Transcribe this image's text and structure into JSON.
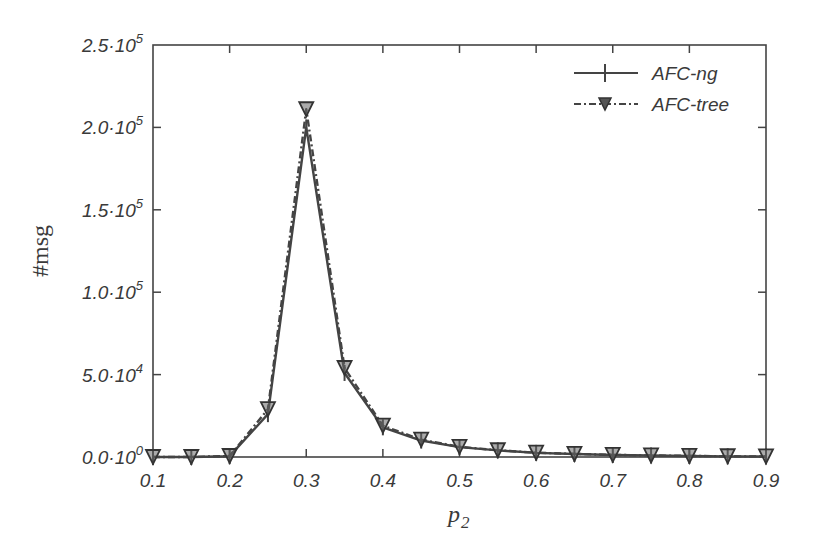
{
  "chart_data": {
    "type": "line",
    "title": "",
    "xlabel": "p_2",
    "ylabel": "#msg",
    "xlim": [
      0.1,
      0.9
    ],
    "ylim": [
      0,
      250000
    ],
    "grid": false,
    "legend_position": "upper right",
    "x_ticks": [
      "0.1",
      "0.2",
      "0.3",
      "0.4",
      "0.5",
      "0.6",
      "0.7",
      "0.8",
      "0.9"
    ],
    "y_ticks": [
      {
        "mant": "0.0",
        "exp": "0"
      },
      {
        "mant": "5.0",
        "exp": "4"
      },
      {
        "mant": "1.0",
        "exp": "5"
      },
      {
        "mant": "1.5",
        "exp": "5"
      },
      {
        "mant": "2.0",
        "exp": "5"
      },
      {
        "mant": "2.5",
        "exp": "5"
      }
    ],
    "x": [
      0.1,
      0.15,
      0.2,
      0.25,
      0.3,
      0.35,
      0.4,
      0.45,
      0.5,
      0.55,
      0.6,
      0.65,
      0.7,
      0.75,
      0.8,
      0.85,
      0.9
    ],
    "series": [
      {
        "name": "AFC-ng",
        "marker": "plus",
        "line": "solid",
        "values": [
          0,
          0,
          500,
          26000,
          200000,
          51000,
          18000,
          10000,
          6000,
          4000,
          2500,
          1800,
          1200,
          900,
          600,
          400,
          300
        ]
      },
      {
        "name": "AFC-tree",
        "marker": "triangle-down",
        "line": "dash-dot",
        "values": [
          0,
          0,
          600,
          29000,
          211000,
          54000,
          19000,
          10500,
          6200,
          4100,
          2600,
          1900,
          1300,
          950,
          650,
          450,
          320
        ]
      }
    ]
  },
  "labels": {
    "xlabel_main": "p",
    "xlabel_sub": "2",
    "ylabel": "#msg",
    "legend_ng": "AFC-ng",
    "legend_tree": "AFC-tree"
  }
}
